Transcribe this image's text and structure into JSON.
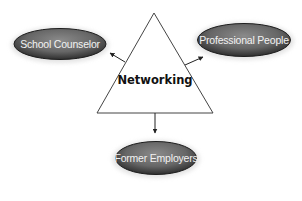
{
  "diagram": {
    "title": "Networking",
    "center": {
      "label": "Networking",
      "shape": "triangle"
    },
    "nodes": [
      {
        "id": "school-counselor",
        "label": "School Counselor",
        "position": "top-left"
      },
      {
        "id": "professional-people",
        "label": "Professional People",
        "position": "top-right"
      },
      {
        "id": "former-employers",
        "label": "Former Employers",
        "position": "bottom"
      }
    ],
    "edges": [
      {
        "from": "Networking",
        "to": "School Counselor",
        "arrow": "to"
      },
      {
        "from": "Networking",
        "to": "Professional People",
        "arrow": "to"
      },
      {
        "from": "Networking",
        "to": "Former Employers",
        "arrow": "to"
      }
    ],
    "colors": {
      "ellipse_fill": "#6e6e6e",
      "ellipse_dark": "#2a2a2a",
      "ellipse_label": "#f2f2f2",
      "lines": "#333333",
      "center_text": "#111111"
    }
  }
}
